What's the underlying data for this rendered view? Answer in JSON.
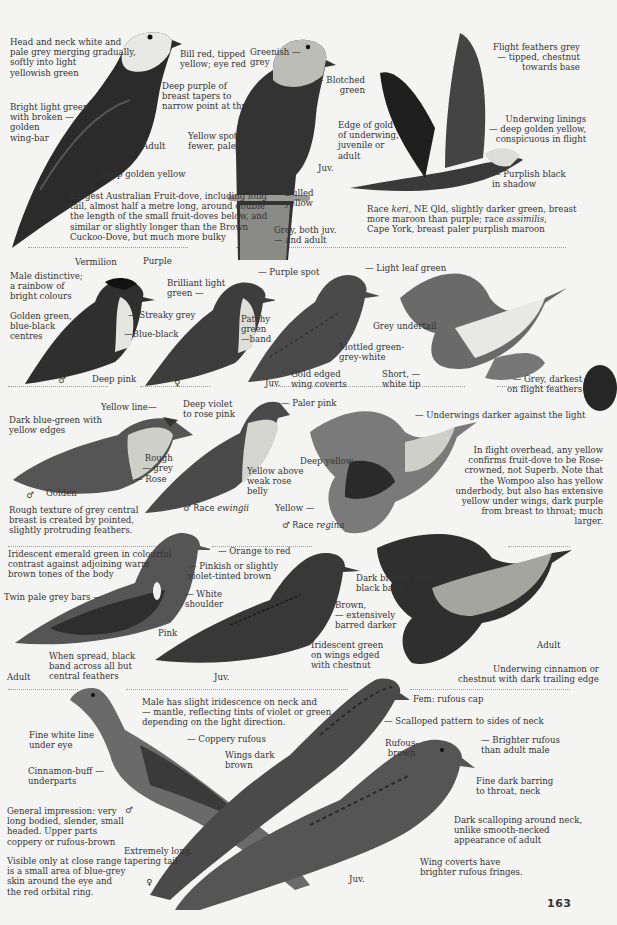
{
  "page_number": "163",
  "sections": [
    {
      "id": "wompoo",
      "labels": {
        "head_neck": "Head and neck white and\npale grey merging gradually,\nsoftly into light\nyellowish green",
        "bill": "Bill red, tipped\nyellow; eye red",
        "breast": "Deep purple of\nbreast tapers to\nnarrow point at throat.",
        "wing": "Bright light green\nwith broken —\ngolden\nwing-bar",
        "adult": "Adult",
        "vent": "Deep golden yellow",
        "note": "Largest Australian Fruit-dove, including long\ntail, almost half a metre long, around double\nthe length of the small fruit-doves below, and\nsimilar or slightly longer than the Brown\nCuckoo-Dove, but much more bulky",
        "juv_head": "Greenish —\ngrey",
        "juv_blotch": "— Blotched\ngreen",
        "juv_spots": "Yellow spots —\nfewer, paler",
        "juv_edge": "Edge of gold\nof underwing,\njuvenile or\nadult",
        "juv": "Juv.",
        "juv_dulled": "Dulled\nyellow",
        "juv_tail": "Grey, both juv.\n— and adult",
        "flight_feathers": "Flight feathers grey\n—  tipped, chestnut\ntowards base",
        "underwing": "Underwing linings\n— deep golden yellow,\nconspicuous in flight",
        "purplish": "— Purplish black\nin shadow",
        "race_note_1": "Race ",
        "race_keri": "keri",
        "race_note_2": ", NE Qld, slightly darker green, breast\nmore maroon than purple; race ",
        "race_assimilis": "assimilis",
        "race_note_3": ",\nCape York, breast paler purplish maroon"
      }
    },
    {
      "id": "superb",
      "labels": {
        "vermilion": "Vermilion",
        "purple": "Purple",
        "male_distinctive": "Male distinctive;\na rainbow of\nbright colours",
        "golden_green": "Golden green,\nblue-black\ncentres",
        "streaky": "— Streaky grey",
        "blue_black": "—Blue-black",
        "deep_pink": "Deep pink",
        "male_sym": "♂",
        "female_sym": "♀",
        "brilliant": "Brilliant light\ngreen —",
        "purple_spot": "— Purple spot",
        "patchy": "Patchy\ngreen\n—band",
        "light_leaf": "— Light leaf green",
        "mottled": "Mottled green-\ngrey-white",
        "gold_edged": "Gold edged\nwing coverts",
        "juv": "Juv.",
        "grey_undertail": "Grey undertail",
        "short_tip": "Short, —\nwhite tip",
        "grey_darkest": "— Grey, darkest\non flight feathers"
      }
    },
    {
      "id": "rose-crowned",
      "labels": {
        "yellow_line": "Yellow line—",
        "deep_violet": "Deep violet\nto rose pink",
        "dark_blue_green": "Dark blue-green with\nyellow edges",
        "rough_grey": "Rough\n— grey",
        "rose": "— Rose",
        "golden": "Golden",
        "male_sym": "♂",
        "texture_note": "Rough texture of grey central\nbreast is created by pointed,\nslightly protruding feathers.",
        "paler_pink": "— Paler pink",
        "yellow_above": "Yellow above\nweak rose\nbelly",
        "race_ewingii_prefix": "♂ Race ",
        "race_ewingii": "ewingii",
        "underwings_darker": "— Underwings darker against the light",
        "deep_yellow": "Deep yellow",
        "yellow": "Yellow —",
        "race_regina_prefix": "♂ Race ",
        "race_regina": "regina",
        "flight_note": "In flight overhead, any yellow\nconfirms fruit-dove to be Rose-\ncrowned, not Superb.  Note that\nthe Wompoo also has yellow\nunderbody, but also has extensive\nyellow under wings, dark purple\nfrom breast to throat; much larger."
      }
    },
    {
      "id": "emerald",
      "labels": {
        "iridescent": "Iridescent emerald green in colourful\ncontrast against adjoining warm\nbrown tones of the body",
        "orange_red": "— Orange to red",
        "pinkish": "— Pinkish or slightly\nviolet-tinted brown",
        "twin_bars": "Twin pale grey bars —",
        "white_shoulder": "— White\nshoulder",
        "pink": "Pink",
        "spread": "When spread, black\nband across all but\ncentral feathers",
        "adult": "Adult",
        "juv": "Juv.",
        "dark_brown": "Dark brown, with\nblack band",
        "brown_barred": "Brown,\n— extensively\nbarred darker",
        "iridescent_juv": "Iridescent green\non wings edged\nwith chestnut",
        "adult_flight": "Adult",
        "underwing_cinnamon": "Underwing cinnamon or\nchestnut with dark trailing edge"
      }
    },
    {
      "id": "brown-cuckoo-dove",
      "labels": {
        "iridescence": "Male has slight iridescence on neck and\n— mantle, reflecting tints of violet or green\ndepending on the light direction.",
        "white_line": "Fine white line\nunder eye",
        "coppery": "— Coppery rufous",
        "wings_dark": "Wings dark\nbrown",
        "cinnamon": "Cinnamon-buff —\nunderparts",
        "general": "General impression: very\nlong bodied, slender, small\nheaded.  Upper parts\ncoppery or rufous-brown",
        "male_sym": "♂",
        "extremely_long": "Extremely long,\ntapering tail",
        "female_sym": "♀",
        "visible": "Visible only at close range\nis a small area of blue-grey\nskin around the eye and\nthe red orbital ring.",
        "fem_cap": "Fem: rufous cap",
        "scalloped": "— Scalloped pattern to sides of neck",
        "rufous_brown": "Rufous-\nbrown",
        "brighter": "— Brighter rufous\nthan adult male",
        "fine_barring": "Fine dark barring\nto throat, neck",
        "dark_scalloping": "Dark scalloping around neck,\nunlike smooth-necked\nappearance of adult",
        "wing_coverts": "Wing coverts have\nbrighter rufous fringes.",
        "juv": "Juv."
      }
    }
  ]
}
